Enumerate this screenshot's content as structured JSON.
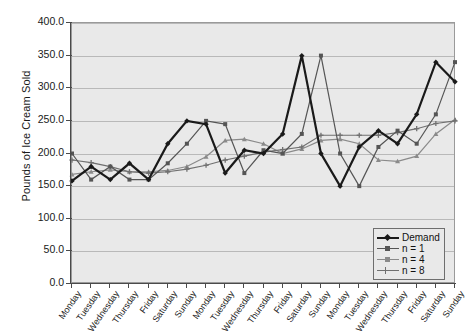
{
  "chart_data": {
    "type": "line",
    "title": "",
    "xlabel": "",
    "ylabel": "Pounds of Ice Cream Sold",
    "ylim": [
      0,
      400
    ],
    "ytick_labels": [
      "0.0",
      "50.0",
      "100.0",
      "150.0",
      "200.0",
      "250.0",
      "300.0",
      "350.0",
      "400.0"
    ],
    "ytick_values": [
      0,
      50,
      100,
      150,
      200,
      250,
      300,
      350,
      400
    ],
    "grid": true,
    "legend_position": "bottom-right",
    "categories": [
      "Monday",
      "Tuesday",
      "Wednesday",
      "Thursday",
      "Friday",
      "Saturday",
      "Sunday",
      "Monday",
      "Tuesday",
      "Wednesday",
      "Thursday",
      "Friday",
      "Saturday",
      "Sunday",
      "Monday",
      "Tuesday",
      "Wednesday",
      "Thursday",
      "Friday",
      "Saturday",
      "Sunday"
    ],
    "series": [
      {
        "name": "Demand",
        "color": "#1a1a1a",
        "marker": "diamond",
        "width": 2.2,
        "values": [
          158,
          180,
          160,
          185,
          160,
          215,
          250,
          245,
          170,
          205,
          200,
          230,
          350,
          200,
          150,
          210,
          235,
          215,
          260,
          340,
          310
        ]
      },
      {
        "name": "n = 1",
        "color": "#555555",
        "marker": "square",
        "width": 1.2,
        "values": [
          200,
          160,
          180,
          160,
          160,
          185,
          215,
          250,
          245,
          170,
          205,
          200,
          230,
          350,
          200,
          150,
          210,
          235,
          215,
          260,
          340
        ]
      },
      {
        "name": "n = 4",
        "color": "#8a8a8a",
        "marker": "triangle",
        "width": 1.2,
        "values": [
          168,
          172,
          175,
          172,
          172,
          174,
          180,
          195,
          220,
          222,
          215,
          200,
          207,
          220,
          222,
          215,
          190,
          188,
          196,
          230,
          252
        ]
      },
      {
        "name": "n = 8",
        "color": "#707070",
        "marker": "cross",
        "width": 1.2,
        "values": [
          190,
          186,
          180,
          172,
          170,
          172,
          176,
          182,
          190,
          196,
          202,
          206,
          210,
          228,
          228,
          228,
          228,
          232,
          238,
          246,
          250
        ]
      }
    ]
  },
  "legend": {
    "items": [
      {
        "label": "Demand"
      },
      {
        "label": "n = 1"
      },
      {
        "label": "n = 4"
      },
      {
        "label": "n = 8"
      }
    ]
  }
}
